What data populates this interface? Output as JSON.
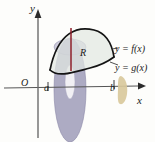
{
  "figure": {
    "axes": {
      "y_label": "y",
      "x_label": "x",
      "origin_label": "O",
      "tick_a_label": "a",
      "tick_b_label": "b",
      "axis_color": "#555555",
      "x_axis_y": 88,
      "y_axis_x": 38,
      "x_axis_start": 4,
      "x_axis_end": 140,
      "y_axis_top": 12,
      "y_axis_bottom": 138,
      "tick_a_x": 48,
      "tick_b_x": 114
    },
    "region": {
      "label": "R",
      "fill_color": "#e2e8e2",
      "stroke_color": "#141414",
      "upper_curve_label": "y = f(x)",
      "lower_curve_label": "y = g(x)",
      "upper_curve_path": "M 50,70 C 58,31 78,26 94,30 C 106,33 112,44 114,57",
      "lower_curve_path": "M 50,70 C 58,78 74,72 90,68 C 102,65 110,60 114,57",
      "region_path": "M 50,70 C 58,31 78,26 94,30 C 106,33 112,44 114,57 C 110,60 102,65 90,68 C 74,72 58,78 50,70 Z"
    },
    "sample_segment": {
      "name": "representative-height-segment",
      "color": "#8e1f2b",
      "x": 71,
      "y_top": 28,
      "y_bottom": 71
    },
    "shell": {
      "name": "cylindrical-shell",
      "fill_color": "#9b98b6",
      "hole_fill_color": "#f2f1f5",
      "outline_color": "#8b88a8",
      "outer_cx": 70,
      "outer_cy": 90,
      "outer_rx": 16,
      "outer_ry": 52,
      "hole_cx": 70,
      "hole_cy": 82,
      "hole_rx": 5,
      "hole_ry": 17
    },
    "marker_b": {
      "name": "tan-marker-at-b",
      "fill_color": "#d8c89a",
      "x": 120,
      "y": 76,
      "width": 9,
      "height": 28
    },
    "leader_lines": {
      "f_leader_color": "#3b3b3b",
      "g_leader_color": "#3b3b3b"
    }
  }
}
